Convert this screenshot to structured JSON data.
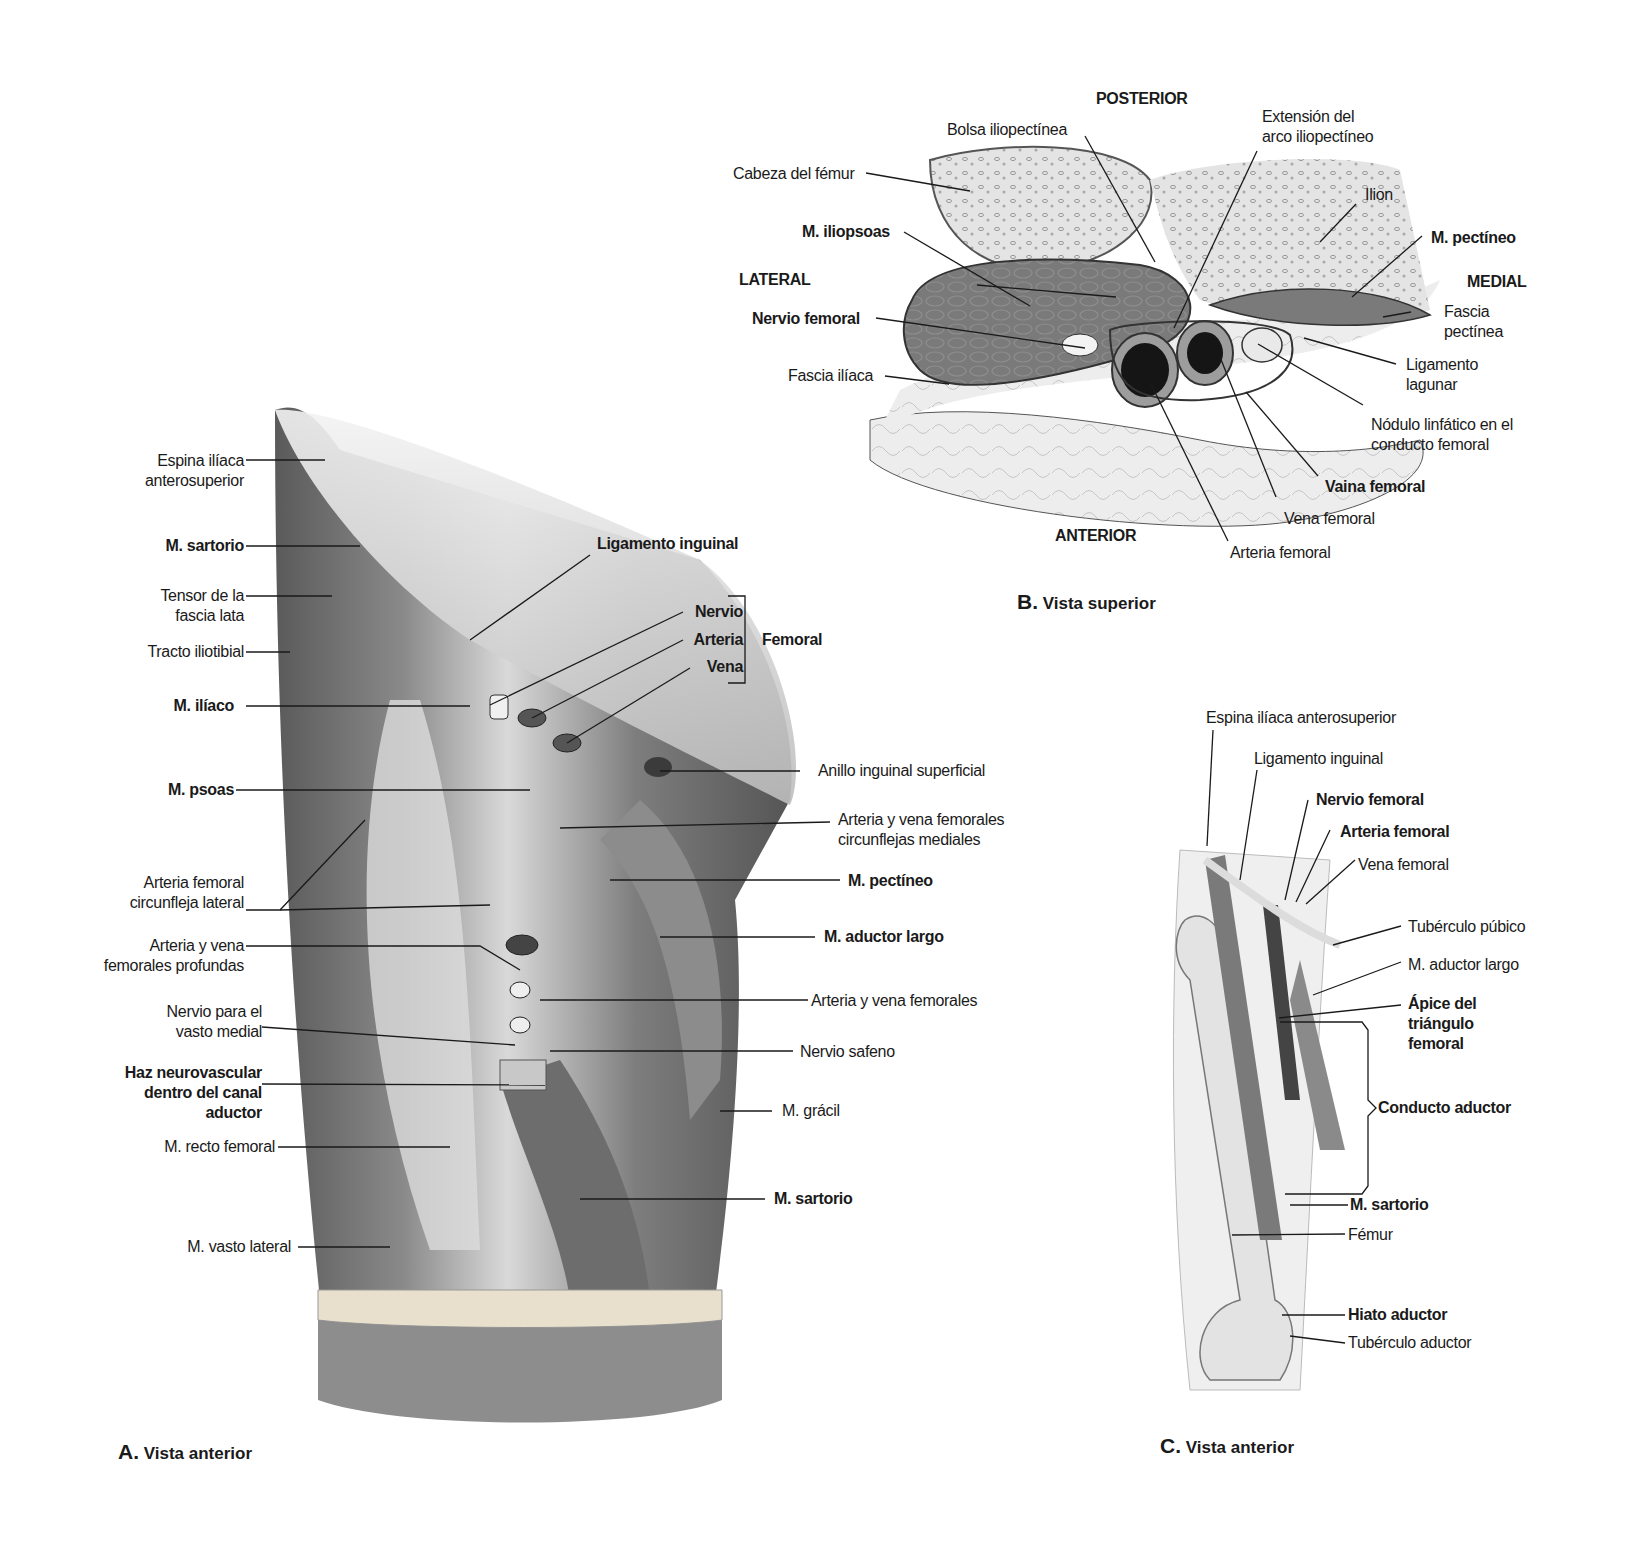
{
  "panel_a": {
    "caption_letter": "A.",
    "caption_text": " Vista anterior",
    "labels_left": [
      {
        "text": "Espina ilíaca\nanterosuperior",
        "bold": false
      },
      {
        "text": "M. sartorio",
        "bold": true
      },
      {
        "text": "Tensor de la\nfascia lata",
        "bold": false
      },
      {
        "text": "Tracto iliotibial",
        "bold": false
      },
      {
        "text": "M. ilíaco",
        "bold": true
      },
      {
        "text": "M. psoas",
        "bold": true
      },
      {
        "text": "Arteria femoral\ncircunfleja lateral",
        "bold": false
      },
      {
        "text": "Arteria y vena\nfemorales profundas",
        "bold": false
      },
      {
        "text": "Nervio para el\nvasto medial",
        "bold": false
      },
      {
        "text": "Haz neurovascular\ndentro del canal\naductor",
        "bold": true
      },
      {
        "text": "M. recto femoral",
        "bold": false
      },
      {
        "text": "M. vasto lateral",
        "bold": false
      }
    ],
    "labels_right": [
      {
        "text": "Ligamento inguinal",
        "bold": true
      },
      {
        "text": "Nervio",
        "bold": true
      },
      {
        "text": "Arteria",
        "bold": true
      },
      {
        "text": "Vena",
        "bold": true
      },
      {
        "text": "Femoral",
        "bold": true
      },
      {
        "text": "Anillo inguinal superficial",
        "bold": false
      },
      {
        "text": "Arteria y vena femorales\ncircunflejas mediales",
        "bold": false
      },
      {
        "text": "M. pectíneo",
        "bold": true
      },
      {
        "text": "M. aductor largo",
        "bold": true
      },
      {
        "text": "Arteria y vena femorales",
        "bold": false
      },
      {
        "text": "Nervio safeno",
        "bold": false
      },
      {
        "text": "M. grácil",
        "bold": false
      },
      {
        "text": "M. sartorio",
        "bold": true
      }
    ]
  },
  "panel_b": {
    "caption_letter": "B.",
    "caption_text": " Vista superior",
    "orientation": {
      "posterior": "POSTERIOR",
      "anterior": "ANTERIOR",
      "lateral": "LATERAL",
      "medial": "MEDIAL"
    },
    "labels": [
      {
        "text": "Bolsa iliopectínea",
        "bold": false
      },
      {
        "text": "Cabeza del fémur",
        "bold": false
      },
      {
        "text": "M. iliopsoas",
        "bold": true
      },
      {
        "text": "Nervio femoral",
        "bold": true
      },
      {
        "text": "Fascia ilíaca",
        "bold": false
      },
      {
        "text": "Extensión del\narco iliopectíneo",
        "bold": false
      },
      {
        "text": "Ilion",
        "bold": false
      },
      {
        "text": "M. pectíneo",
        "bold": true
      },
      {
        "text": "Fascia\npectínea",
        "bold": false
      },
      {
        "text": "Ligamento\nlagunar",
        "bold": false
      },
      {
        "text": "Nódulo linfático en el\nconducto femoral",
        "bold": false
      },
      {
        "text": "Vaina femoral",
        "bold": true
      },
      {
        "text": "Vena femoral",
        "bold": false
      },
      {
        "text": "Arteria femoral",
        "bold": false
      }
    ]
  },
  "panel_c": {
    "caption_letter": "C.",
    "caption_text": " Vista anterior",
    "labels": [
      {
        "text": "Espina ilíaca anterosuperior",
        "bold": false
      },
      {
        "text": "Ligamento inguinal",
        "bold": false
      },
      {
        "text": "Nervio femoral",
        "bold": true
      },
      {
        "text": "Arteria femoral",
        "bold": true
      },
      {
        "text": "Vena femoral",
        "bold": false
      },
      {
        "text": "Tubérculo púbico",
        "bold": false
      },
      {
        "text": "M. aductor largo",
        "bold": false
      },
      {
        "text": "Ápice del\ntriángulo\nfemoral",
        "bold": true
      },
      {
        "text": "Conducto aductor",
        "bold": true
      },
      {
        "text": "M. sartorio",
        "bold": true
      },
      {
        "text": "Fémur",
        "bold": false
      },
      {
        "text": "Hiato aductor",
        "bold": true
      },
      {
        "text": "Tubérculo aductor",
        "bold": false
      }
    ]
  },
  "colors": {
    "ink": "#1a1a1a",
    "muscle_dark": "#6e6e6e",
    "muscle_mid": "#9a9a9a",
    "bone": "#e2e2e2",
    "fat": "#ececec"
  }
}
